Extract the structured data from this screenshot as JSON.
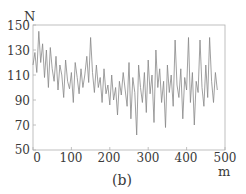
{
  "chart_data": {
    "type": "line",
    "title": "",
    "caption": "(b)",
    "xlabel": "m",
    "ylabel": "N",
    "xlim": [
      0,
      500
    ],
    "ylim": [
      50,
      150
    ],
    "xticks": [
      0,
      100,
      200,
      300,
      400,
      500
    ],
    "yticks": [
      50,
      70,
      90,
      110,
      130,
      150
    ],
    "grid": false,
    "legend": null,
    "series": [
      {
        "name": "N",
        "color": "#888888",
        "x": [
          0,
          5,
          10,
          15,
          20,
          25,
          30,
          35,
          40,
          45,
          50,
          55,
          60,
          65,
          70,
          75,
          80,
          85,
          90,
          95,
          100,
          105,
          110,
          115,
          120,
          125,
          130,
          135,
          140,
          145,
          150,
          155,
          160,
          165,
          170,
          175,
          180,
          185,
          190,
          195,
          200,
          205,
          210,
          215,
          220,
          225,
          230,
          235,
          240,
          245,
          250,
          255,
          260,
          265,
          270,
          275,
          280,
          285,
          290,
          295,
          300,
          305,
          310,
          315,
          320,
          325,
          330,
          335,
          340,
          345,
          350,
          355,
          360,
          365,
          370,
          375,
          380,
          385,
          390,
          395,
          400,
          405,
          410,
          415,
          420,
          425,
          430,
          435,
          440,
          445,
          450,
          455,
          460,
          465,
          470,
          475,
          480
        ],
        "values": [
          118,
          128,
          112,
          145,
          120,
          135,
          108,
          130,
          100,
          132,
          115,
          105,
          125,
          98,
          118,
          110,
          92,
          122,
          105,
          99,
          112,
          88,
          120,
          108,
          95,
          115,
          100,
          110,
          125,
          104,
          140,
          112,
          96,
          118,
          100,
          108,
          88,
          115,
          95,
          102,
          86,
          110,
          90,
          100,
          78,
          105,
          94,
          112,
          98,
          85,
          120,
          75,
          108,
          96,
          62,
          118,
          100,
          88,
          112,
          80,
          122,
          95,
          110,
          72,
          130,
          100,
          115,
          88,
          105,
          68,
          118,
          96,
          110,
          85,
          138,
          102,
          92,
          115,
          75,
          108,
          98,
          140,
          88,
          112,
          70,
          105,
          96,
          138,
          100,
          85,
          118,
          92,
          140,
          105,
          88,
          112,
          98
        ]
      }
    ]
  }
}
